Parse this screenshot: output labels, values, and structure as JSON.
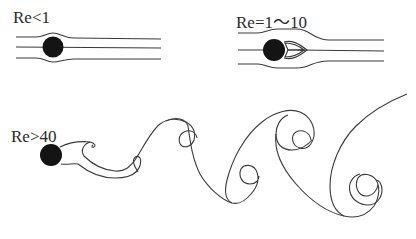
{
  "diagram": {
    "panels": [
      {
        "id": "creeping",
        "label": "Re<1",
        "description": "Attached, symmetric streamlines around cylinder"
      },
      {
        "id": "recirculation",
        "label": "Re=1～10",
        "description": "Pair of symmetric recirculation bubbles behind cylinder"
      },
      {
        "id": "vortex-street",
        "label": "Re>40",
        "description": "Kármán vortex street with alternating shed vortices"
      }
    ],
    "colors": {
      "line": "#3a3a3a",
      "cylinder": "#141414",
      "background": "#ffffff"
    }
  }
}
